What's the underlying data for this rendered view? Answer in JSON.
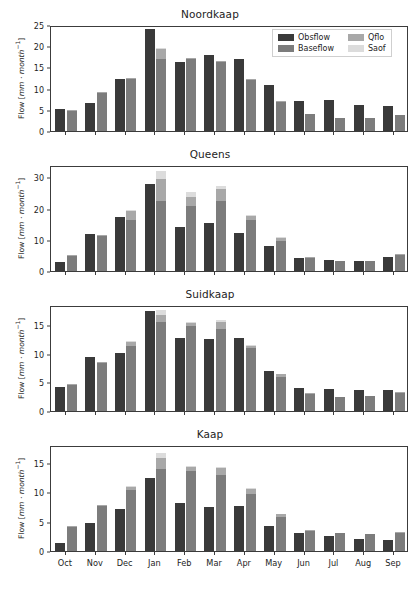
{
  "figure": {
    "width": 420,
    "height": 596,
    "background": "#ffffff"
  },
  "legend": {
    "position": "upper-right-of-panel-0",
    "entries": [
      {
        "label": "Obsflow",
        "color": "#3a3a3a"
      },
      {
        "label": "Qflo",
        "color": "#a8a8a8"
      },
      {
        "label": "Baseflow",
        "color": "#7c7c7c"
      },
      {
        "label": "Saof",
        "color": "#dcdcdc"
      }
    ]
  },
  "colors": {
    "obsflow": "#3a3a3a",
    "baseflow": "#7c7c7c",
    "qflo": "#a8a8a8",
    "saof": "#dcdcdc",
    "axis": "#3c3c3c",
    "text": "#1d1d1d"
  },
  "axis_label_y": "Flow [mm · month⁻¹]",
  "categories": [
    "Oct",
    "Nov",
    "Dec",
    "Jan",
    "Feb",
    "Mar",
    "Apr",
    "May",
    "Jun",
    "Jul",
    "Aug",
    "Sep"
  ],
  "chart_data": [
    {
      "type": "bar",
      "title": "Noordkaap",
      "xlabel": "",
      "ylabel": "Flow [mm · month⁻¹]",
      "ylim": [
        0,
        25
      ],
      "yticks": [
        0,
        5,
        10,
        15,
        20,
        25
      ],
      "grid": false,
      "legend": "upper right",
      "categories": [
        "Oct",
        "Nov",
        "Dec",
        "Jan",
        "Feb",
        "Mar",
        "Apr",
        "May",
        "Jun",
        "Jul",
        "Aug",
        "Sep"
      ],
      "series": [
        {
          "name": "Obsflow",
          "stack": "obs",
          "values": [
            5.2,
            6.5,
            12.3,
            24.1,
            16.2,
            17.9,
            16.9,
            10.8,
            7.1,
            7.2,
            6.2,
            5.8
          ]
        },
        {
          "name": "Baseflow",
          "stack": "sim",
          "values": [
            4.8,
            9.0,
            12.4,
            17.0,
            16.9,
            16.4,
            12.0,
            6.9,
            3.9,
            3.0,
            3.0,
            3.8
          ]
        },
        {
          "name": "Qflo",
          "stack": "sim",
          "values": [
            0.1,
            0.1,
            0.1,
            2.3,
            0.3,
            0.2,
            0.2,
            0.1,
            0.0,
            0.0,
            0.0,
            0.0
          ]
        },
        {
          "name": "Saof",
          "stack": "sim",
          "values": [
            0.0,
            0.0,
            0.0,
            0.2,
            0.0,
            0.0,
            0.0,
            0.0,
            0.0,
            0.0,
            0.0,
            0.0
          ]
        }
      ]
    },
    {
      "type": "bar",
      "title": "Queens",
      "xlabel": "",
      "ylabel": "Flow [mm · month⁻¹]",
      "ylim": [
        0,
        34
      ],
      "yticks": [
        0,
        10,
        20,
        30
      ],
      "grid": false,
      "legend": "none",
      "categories": [
        "Oct",
        "Nov",
        "Dec",
        "Jan",
        "Feb",
        "Mar",
        "Apr",
        "May",
        "Jun",
        "Jul",
        "Aug",
        "Sep"
      ],
      "series": [
        {
          "name": "Obsflow",
          "stack": "obs",
          "values": [
            3.0,
            12.0,
            17.2,
            27.8,
            14.0,
            15.5,
            12.3,
            8.0,
            4.3,
            3.4,
            3.3,
            4.6
          ]
        },
        {
          "name": "Baseflow",
          "stack": "sim",
          "values": [
            5.0,
            11.2,
            16.5,
            22.5,
            21.0,
            22.6,
            16.4,
            9.6,
            4.3,
            3.2,
            3.3,
            5.3
          ]
        },
        {
          "name": "Qflo",
          "stack": "sim",
          "values": [
            0.2,
            0.2,
            2.6,
            7.0,
            2.8,
            3.6,
            1.4,
            1.2,
            0.1,
            0.0,
            0.0,
            0.2
          ]
        },
        {
          "name": "Saof",
          "stack": "sim",
          "values": [
            0.0,
            0.0,
            0.4,
            2.7,
            1.5,
            1.1,
            0.3,
            0.1,
            0.0,
            0.0,
            0.0,
            0.0
          ]
        }
      ]
    },
    {
      "type": "bar",
      "title": "Suidkaap",
      "xlabel": "",
      "ylabel": "Flow [mm · month⁻¹]",
      "ylim": [
        0,
        18.5
      ],
      "yticks": [
        0,
        5,
        10,
        15
      ],
      "grid": false,
      "legend": "none",
      "categories": [
        "Oct",
        "Nov",
        "Dec",
        "Jan",
        "Feb",
        "Mar",
        "Apr",
        "May",
        "Jun",
        "Jul",
        "Aug",
        "Sep"
      ],
      "series": [
        {
          "name": "Obsflow",
          "stack": "obs",
          "values": [
            4.2,
            9.5,
            10.2,
            17.5,
            12.7,
            12.5,
            12.8,
            7.0,
            4.0,
            3.8,
            3.6,
            3.6
          ]
        },
        {
          "name": "Baseflow",
          "stack": "sim",
          "values": [
            4.6,
            8.4,
            11.4,
            15.5,
            14.9,
            14.4,
            11.0,
            6.0,
            3.0,
            2.5,
            2.6,
            3.3
          ]
        },
        {
          "name": "Qflo",
          "stack": "sim",
          "values": [
            0.1,
            0.1,
            0.7,
            1.3,
            0.5,
            1.1,
            0.4,
            0.4,
            0.1,
            0.0,
            0.0,
            0.1
          ]
        },
        {
          "name": "Saof",
          "stack": "sim",
          "values": [
            0.0,
            0.0,
            0.1,
            0.8,
            0.2,
            0.3,
            0.1,
            0.0,
            0.0,
            0.0,
            0.0,
            0.0
          ]
        }
      ]
    },
    {
      "type": "bar",
      "title": "Kaap",
      "xlabel": "",
      "ylabel": "Flow [mm · month⁻¹]",
      "ylim": [
        0,
        18
      ],
      "yticks": [
        0,
        5,
        10,
        15
      ],
      "grid": false,
      "legend": "none",
      "categories": [
        "Oct",
        "Nov",
        "Dec",
        "Jan",
        "Feb",
        "Mar",
        "Apr",
        "May",
        "Jun",
        "Jul",
        "Aug",
        "Sep"
      ],
      "series": [
        {
          "name": "Obsflow",
          "stack": "obs",
          "values": [
            1.4,
            4.7,
            7.1,
            12.4,
            8.1,
            7.4,
            7.7,
            4.3,
            3.0,
            2.6,
            2.0,
            1.9
          ]
        },
        {
          "name": "Baseflow",
          "stack": "sim",
          "values": [
            4.2,
            7.6,
            10.4,
            14.0,
            13.6,
            12.9,
            9.6,
            5.7,
            3.4,
            3.1,
            2.9,
            3.2
          ]
        },
        {
          "name": "Qflo",
          "stack": "sim",
          "values": [
            0.1,
            0.2,
            0.6,
            1.8,
            0.8,
            1.3,
            1.0,
            0.6,
            0.1,
            0.0,
            0.0,
            0.1
          ]
        },
        {
          "name": "Saof",
          "stack": "sim",
          "values": [
            0.0,
            0.0,
            0.1,
            0.9,
            0.1,
            0.1,
            0.1,
            0.0,
            0.0,
            0.0,
            0.0,
            0.0
          ]
        }
      ]
    }
  ]
}
